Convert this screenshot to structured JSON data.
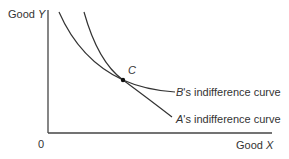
{
  "y_axis_label": {
    "text": "Good ",
    "var": "Y"
  },
  "x_axis_label": {
    "text": "Good ",
    "var": "X"
  },
  "origin": "0",
  "point": "C",
  "curves": [
    {
      "var": "B",
      "text": "'s indifference curve"
    },
    {
      "var": "A",
      "text": "'s indifference curve"
    }
  ]
}
